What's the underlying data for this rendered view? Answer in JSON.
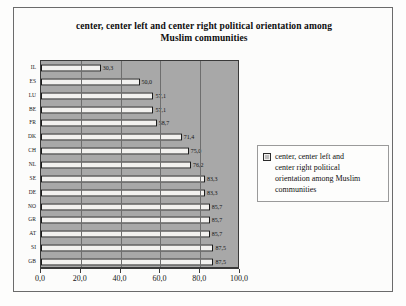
{
  "chart_data": {
    "type": "bar",
    "orientation": "horizontal",
    "title": "center, center left and center right political orientation among Muslim communities",
    "title_line1": "center, center left and center right political orientation among",
    "title_line2": "Muslim communities",
    "categories": [
      "IL",
      "ES",
      "LU",
      "BE",
      "FR",
      "DK",
      "CH",
      "NL",
      "SE",
      "DE",
      "NO",
      "GR",
      "AT",
      "SI",
      "GB"
    ],
    "values": [
      30.3,
      50.0,
      57.1,
      57.1,
      58.7,
      71.4,
      75.0,
      76.2,
      83.3,
      83.3,
      85.7,
      85.7,
      85.7,
      87.5,
      87.5
    ],
    "value_labels": [
      "30,3",
      "50,0",
      "57,1",
      "57,1",
      "58,7",
      "71,4",
      "75,0",
      "76,2",
      "83,3",
      "83,3",
      "85,7",
      "85,7",
      "85,7",
      "87,5",
      "87,5"
    ],
    "xlabel": "",
    "ylabel": "",
    "xlim": [
      0,
      100
    ],
    "xticks": [
      0,
      20,
      40,
      60,
      80,
      100
    ],
    "xtick_labels": [
      "0,0",
      "20,0",
      "40,0",
      "60,0",
      "80,0",
      "100,0"
    ],
    "grid": true,
    "grid_axis": "x",
    "legend_position": "right",
    "legend": [
      "center, center left and center right political orientation among Muslim communities"
    ],
    "colors": {
      "plot_background": "#a8a8a8",
      "bar_fill": "#f2f1ef",
      "bar_border": "#1b1b1b",
      "gridline": "#6e6e6e",
      "frame_border": "#6b6b6b",
      "text": "#111111"
    }
  },
  "legend": {
    "line1": "center, center left and",
    "line2": "center right political",
    "line3": "orientation among Muslim",
    "line4": "communities"
  }
}
